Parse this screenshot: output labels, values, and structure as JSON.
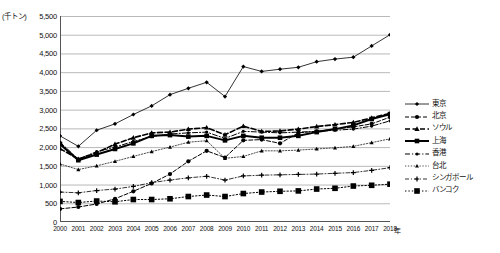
{
  "chart_data": {
    "type": "line",
    "title": "",
    "unit_label": "(千トン)",
    "xlabel": "年",
    "ylabel": "",
    "grid": true,
    "legend_position": "right",
    "ylim": [
      0,
      5500
    ],
    "ytick_step": 500,
    "yticks": [
      "5,500",
      "5,000",
      "4,500",
      "4,000",
      "3,500",
      "3,000",
      "2,500",
      "2,000",
      "1,500",
      "1,000",
      "500",
      "0"
    ],
    "ytick_values": [
      5500,
      5000,
      4500,
      4000,
      3500,
      3000,
      2500,
      2000,
      1500,
      1000,
      500,
      0
    ],
    "categories": [
      "2000",
      "2001",
      "2002",
      "2003",
      "2004",
      "2005",
      "2006",
      "2007",
      "2008",
      "2009",
      "2010",
      "2011",
      "2012",
      "2013",
      "2014",
      "2015",
      "2016",
      "2017",
      "2018"
    ],
    "x": [
      2000,
      2001,
      2002,
      2003,
      2004,
      2005,
      2006,
      2007,
      2008,
      2009,
      2010,
      2011,
      2012,
      2013,
      2014,
      2015,
      2016,
      2017,
      2018
    ],
    "series": [
      {
        "name": "東京",
        "style": "solid-thin",
        "marker": "diamond",
        "values": [
          2300,
          2020,
          2450,
          2620,
          2870,
          3100,
          3400,
          3570,
          3730,
          3350,
          4150,
          4020,
          4080,
          4130,
          4280,
          4350,
          4400,
          4700,
          5000
        ]
      },
      {
        "name": "北京",
        "style": "dashed",
        "marker": "circle",
        "values": [
          350,
          400,
          480,
          620,
          820,
          1030,
          1280,
          1620,
          1900,
          1720,
          2180,
          2200,
          2100,
          2380,
          2420,
          2480,
          2540,
          2620,
          2800
        ]
      },
      {
        "name": "ソウル",
        "style": "dashed-bold",
        "marker": "triangle",
        "values": [
          1960,
          1680,
          1850,
          2080,
          2250,
          2380,
          2400,
          2480,
          2520,
          2330,
          2560,
          2420,
          2430,
          2480,
          2550,
          2600,
          2660,
          2780,
          2900
        ]
      },
      {
        "name": "上海",
        "style": "solid-bold",
        "marker": "square",
        "values": [
          2080,
          1650,
          1800,
          1950,
          2100,
          2300,
          2320,
          2280,
          2300,
          2180,
          2300,
          2250,
          2250,
          2300,
          2400,
          2480,
          2580,
          2750,
          2880
        ]
      },
      {
        "name": "香港",
        "style": "dash-dot",
        "marker": "circle-small",
        "values": [
          2130,
          1680,
          1880,
          2000,
          2150,
          2280,
          2350,
          2380,
          2400,
          2230,
          2420,
          2400,
          2380,
          2400,
          2420,
          2450,
          2480,
          2560,
          2700
        ]
      },
      {
        "name": "台北",
        "style": "dotted-thin",
        "marker": "triangle-small",
        "values": [
          1550,
          1400,
          1500,
          1620,
          1750,
          1880,
          2000,
          2130,
          2170,
          1700,
          1750,
          1900,
          1900,
          1920,
          1950,
          1980,
          2020,
          2120,
          2220
        ]
      },
      {
        "name": "シンガポール",
        "style": "dash-dot-thin",
        "marker": "plus",
        "values": [
          800,
          780,
          840,
          880,
          950,
          1050,
          1120,
          1180,
          1220,
          1120,
          1230,
          1250,
          1260,
          1270,
          1280,
          1300,
          1320,
          1380,
          1450
        ]
      },
      {
        "name": "バンコク",
        "style": "dotted",
        "marker": "square-big",
        "values": [
          550,
          520,
          560,
          540,
          600,
          600,
          620,
          680,
          720,
          680,
          760,
          800,
          820,
          830,
          880,
          900,
          960,
          980,
          1010
        ]
      }
    ]
  }
}
